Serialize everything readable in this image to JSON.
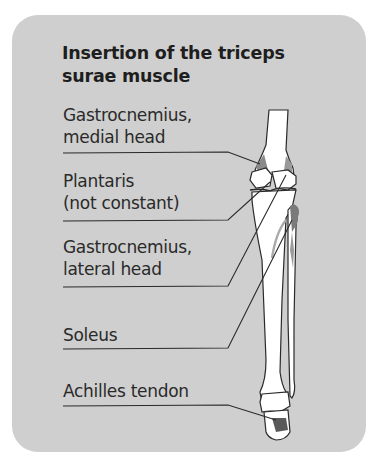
{
  "title": "Insertion of the triceps surae muscle",
  "title_lines": [
    "Insertion of the triceps",
    "surae muscle"
  ],
  "labels": [
    {
      "id": "gastrocnemius-medial",
      "lines": [
        "Gastrocnemius,",
        "medial head"
      ]
    },
    {
      "id": "plantaris",
      "lines": [
        "Plantaris",
        "(not constant)"
      ]
    },
    {
      "id": "gastrocnemius-lateral",
      "lines": [
        "Gastrocnemius,",
        "lateral head"
      ]
    },
    {
      "id": "soleus",
      "lines": [
        "Soleus"
      ]
    },
    {
      "id": "achilles",
      "lines": [
        "Achilles tendon"
      ]
    }
  ],
  "colors": {
    "background": "#cfcfcf",
    "bone": "#ffffff",
    "outline": "#2a2a2a",
    "muscle_insertion": "#7a7a7a"
  }
}
